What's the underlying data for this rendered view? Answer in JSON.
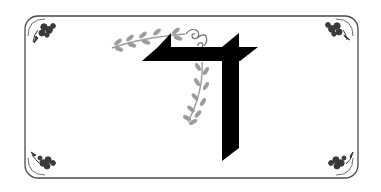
{
  "illustration": {
    "subject": "Hebrew letter Dalet",
    "glyph": "ד",
    "colors": {
      "background": "#ffffff",
      "letter": "#000000",
      "vine": "#9a9a9a",
      "frame": "#444444",
      "corner_ornament": "#333333"
    }
  },
  "frame": {
    "style": "double rounded border",
    "corners": [
      "top-left-ornament",
      "top-right-ornament",
      "bottom-left-ornament",
      "bottom-right-ornament"
    ]
  }
}
